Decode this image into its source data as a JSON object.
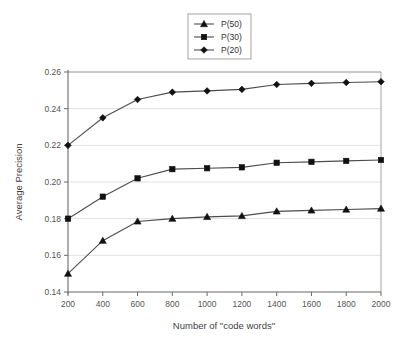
{
  "chart_data": {
    "type": "line",
    "title": "",
    "xlabel": "Number of \"code words\"",
    "ylabel": "Average Precision",
    "x": [
      200,
      400,
      600,
      800,
      1000,
      1200,
      1400,
      1600,
      1800,
      2000
    ],
    "xticklabels": [
      "200",
      "400",
      "600",
      "800",
      "1000",
      "1200",
      "1400",
      "1600",
      "1800",
      "2000"
    ],
    "yticklabels": [
      "0.14",
      "0.16",
      "0.18",
      "0.20",
      "0.22",
      "0.24",
      "0.26"
    ],
    "yticks": [
      0.14,
      0.16,
      0.18,
      0.2,
      0.22,
      0.24,
      0.26
    ],
    "xlim": [
      200,
      2000
    ],
    "ylim": [
      0.14,
      0.26
    ],
    "grid": "horizontal",
    "legend_position": "top-center",
    "series": [
      {
        "name": "P(50)",
        "marker": "triangle",
        "color": "#111111",
        "values": [
          0.15,
          0.168,
          0.1785,
          0.18,
          0.181,
          0.1815,
          0.184,
          0.1845,
          0.185,
          0.1855
        ]
      },
      {
        "name": "P(30)",
        "marker": "square",
        "color": "#111111",
        "values": [
          0.18,
          0.192,
          0.202,
          0.207,
          0.2075,
          0.208,
          0.2105,
          0.211,
          0.2115,
          0.212
        ]
      },
      {
        "name": "P(20)",
        "marker": "diamond",
        "color": "#111111",
        "values": [
          0.22,
          0.235,
          0.245,
          0.249,
          0.2497,
          0.2505,
          0.2532,
          0.2538,
          0.2543,
          0.2547
        ]
      }
    ]
  },
  "legend": {
    "entries": [
      {
        "label": "P(50)"
      },
      {
        "label": "P(30)"
      },
      {
        "label": "P(20)"
      }
    ]
  },
  "axes": {
    "y_title": "Average Precision",
    "x_title": "Number of \"code words\""
  }
}
